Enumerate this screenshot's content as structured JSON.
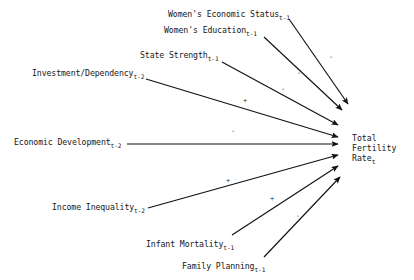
{
  "figure": {
    "type": "path-diagram",
    "background_color": "#ffffff",
    "line_color": "#111111",
    "text_color": "#161616"
  },
  "target": {
    "name": "total-fertility-rate",
    "line1": "Total",
    "line2": "Fertility",
    "line3": "Rate",
    "subscript": "t",
    "x": 352,
    "y": 133
  },
  "nodes": [
    {
      "id": "womens-economic-status",
      "label": "Women's Economic Status",
      "subscript": "t-1",
      "x": 168,
      "y": 10,
      "sign": "-",
      "sign_x": 329,
      "sign_y": 54,
      "arrow": {
        "x1": 289,
        "y1": 19,
        "x2": 348,
        "y2": 104
      }
    },
    {
      "id": "womens-education",
      "label": "Women's Education",
      "subscript": "t-1",
      "x": 164,
      "y": 26,
      "sign": "-",
      "sign_x": 297,
      "sign_y": 70,
      "arrow": {
        "x1": 264,
        "y1": 37,
        "x2": 342,
        "y2": 110
      }
    },
    {
      "id": "state-strength",
      "label": "State Strength",
      "subscript": "t-1",
      "x": 140,
      "y": 51,
      "sign": "-",
      "sign_x": 281,
      "sign_y": 86,
      "arrow": {
        "x1": 222,
        "y1": 62,
        "x2": 338,
        "y2": 125
      }
    },
    {
      "id": "investment-dependency",
      "label": "Investment/Dependency",
      "subscript": "t-2",
      "x": 32,
      "y": 69,
      "sign": "+",
      "sign_x": 243,
      "sign_y": 98,
      "arrow": {
        "x1": 146,
        "y1": 79,
        "x2": 338,
        "y2": 137
      }
    },
    {
      "id": "economic-development",
      "label": "Economic Development",
      "subscript": "t-2",
      "x": 14,
      "y": 138,
      "sign": "-",
      "sign_x": 231,
      "sign_y": 128,
      "arrow": {
        "x1": 127,
        "y1": 144,
        "x2": 338,
        "y2": 144
      }
    },
    {
      "id": "income-inequality",
      "label": "Income Inequality",
      "subscript": "t-2",
      "x": 52,
      "y": 203,
      "sign": "+",
      "sign_x": 226,
      "sign_y": 178,
      "arrow": {
        "x1": 148,
        "y1": 208,
        "x2": 338,
        "y2": 155
      }
    },
    {
      "id": "infant-mortality",
      "label": "Infant Mortality",
      "subscript": "t-1",
      "x": 146,
      "y": 240,
      "sign": "+",
      "sign_x": 270,
      "sign_y": 196,
      "arrow": {
        "x1": 232,
        "y1": 235,
        "x2": 338,
        "y2": 166
      }
    },
    {
      "id": "family-planning",
      "label": "Family Planning",
      "subscript": "t-1",
      "x": 182,
      "y": 262,
      "sign": "-",
      "sign_x": 296,
      "sign_y": 213,
      "arrow": {
        "x1": 264,
        "y1": 257,
        "x2": 340,
        "y2": 177
      }
    }
  ]
}
